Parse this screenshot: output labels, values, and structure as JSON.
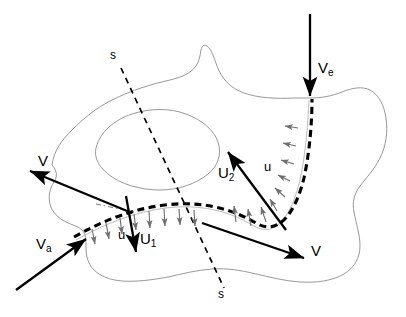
{
  "figure": {
    "background_color": "#ffffff",
    "line_color": "#000000",
    "boundary_color": "#8c8c8c",
    "arrow_color": "#000000",
    "small_arrow_color": "#6e6e6e",
    "width": 406,
    "height": 317
  },
  "labels": {
    "velocity_left": "V",
    "velocity_right": "V",
    "velocity_ambient": "V",
    "velocity_ambient_sub": "a",
    "velocity_entry": "V",
    "velocity_entry_sub": "e",
    "interface_speed_1": "U",
    "interface_speed_1_sub": "1",
    "interface_speed_2": "U",
    "interface_speed_2_sub": "2",
    "normal_velocity_lower": "u",
    "normal_velocity_upper": "u",
    "section_top": "s",
    "section_bottom": "s"
  },
  "label_positions": {
    "velocity_left": {
      "x": 38,
      "y": 153
    },
    "velocity_ambient": {
      "x": 36,
      "y": 236
    },
    "velocity_entry": {
      "x": 318,
      "y": 60
    },
    "interface_speed_1": {
      "x": 140,
      "y": 231
    },
    "interface_speed_2": {
      "x": 218,
      "y": 165
    },
    "normal_velocity_lower": {
      "x": 118,
      "y": 228
    },
    "normal_velocity_upper": {
      "x": 264,
      "y": 160
    },
    "velocity_right": {
      "x": 311,
      "y": 243
    },
    "section_top": {
      "x": 110,
      "y": 49
    },
    "section_bottom": {
      "x": 218,
      "y": 288
    }
  },
  "vectors": [
    {
      "name": "V-left",
      "label": "V",
      "from": [
        130,
        212
      ],
      "to": [
        28,
        170
      ]
    },
    {
      "name": "V-a",
      "label": "Va",
      "from": [
        18,
        288
      ],
      "to": [
        85,
        238
      ]
    },
    {
      "name": "V-e",
      "label": "Ve",
      "from": [
        310,
        14
      ],
      "to": [
        310,
        98
      ]
    },
    {
      "name": "U-1",
      "label": "U1",
      "from": [
        126,
        196
      ],
      "to": [
        136,
        252
      ]
    },
    {
      "name": "U-2",
      "label": "U2",
      "from": [
        284,
        228
      ],
      "to": [
        228,
        152
      ]
    },
    {
      "name": "V-right",
      "label": "V",
      "from": [
        203,
        224
      ],
      "to": [
        305,
        258
      ]
    }
  ],
  "section_line": {
    "name": "s-s",
    "from": [
      121,
      68
    ],
    "to": [
      224,
      288
    ],
    "style": "dashed"
  },
  "interface": {
    "name": "dashed-interface-curve",
    "style": "heavy-dashed",
    "description": "Curve entering at lower-left, arcing across the region and turning upward to the Ve entry point at the top boundary"
  },
  "normal_arrows": {
    "lower_segment_direction": "downward-inward",
    "upper_segment_direction": "leftward-inward",
    "count_lower": 8,
    "count_upper": 9
  }
}
